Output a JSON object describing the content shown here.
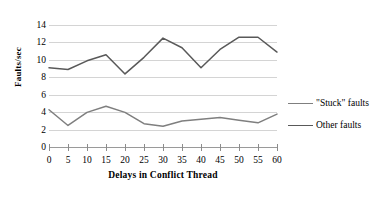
{
  "chart_data": {
    "type": "line",
    "title": "",
    "xlabel": "Delays in Conflict Thread",
    "ylabel": "Faults/sec",
    "x": [
      0,
      5,
      10,
      15,
      20,
      25,
      30,
      35,
      40,
      45,
      50,
      55,
      60
    ],
    "xlim": [
      0,
      60
    ],
    "ylim": [
      0,
      14
    ],
    "xticks": [
      "0",
      "5",
      "10",
      "15",
      "20",
      "25",
      "30",
      "35",
      "40",
      "45",
      "50",
      "55",
      "60"
    ],
    "yticks": [
      "0",
      "2",
      "4",
      "6",
      "8",
      "10",
      "12",
      "14"
    ],
    "grid": true,
    "legend_position": "right",
    "series": [
      {
        "name": "\"Stuck\" faults",
        "color": "#7f7f7f",
        "values": [
          4.3,
          2.5,
          4.0,
          4.7,
          4.0,
          2.7,
          2.4,
          3.0,
          3.2,
          3.4,
          3.1,
          2.8,
          3.8
        ]
      },
      {
        "name": "Other faults",
        "color": "#595959",
        "values": [
          9.1,
          8.9,
          9.9,
          10.6,
          8.4,
          10.3,
          12.5,
          11.4,
          9.1,
          11.2,
          12.6,
          12.6,
          10.9
        ]
      }
    ]
  },
  "legend": {
    "entries": [
      {
        "label": "\"Stuck\" faults",
        "color": "#7f7f7f"
      },
      {
        "label": "Other faults",
        "color": "#595959"
      }
    ]
  },
  "axes": {
    "y_title": "Faults/sec",
    "x_title": "Delays in Conflict Thread"
  }
}
